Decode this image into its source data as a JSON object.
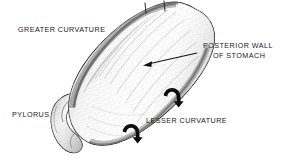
{
  "figure": {
    "kind": "anatomical-line-drawing",
    "subject": "stomach",
    "view": "posterior-oblique",
    "background_color": "#ffffff",
    "ink_color": "#1a1a1a",
    "width": 285,
    "height": 164
  },
  "labels": {
    "greater_curvature": "GREATER CURVATURE",
    "pylorus": "PYLORUS",
    "lesser_curvature": "LESSER CURVATURE",
    "posterior_wall_line1": "POSTERIOR WALL",
    "posterior_wall_line2": "OF STOMACH"
  },
  "annotations": {
    "leader_arrow": {
      "name": "posterior-wall-leader-arrow",
      "from_x": 197,
      "from_y": 53,
      "to_x": 144,
      "to_y": 65,
      "direction": "down-left"
    },
    "curved_arrows": [
      {
        "name": "rotation-arrow-upper",
        "x": 172,
        "y": 96,
        "rotation_deg": 0
      },
      {
        "name": "rotation-arrow-lower",
        "x": 131,
        "y": 132,
        "rotation_deg": 0
      }
    ],
    "fundus_ticks": [
      {
        "name": "fundus-tick-left",
        "x": 145,
        "y": 8
      },
      {
        "name": "fundus-tick-right",
        "x": 164,
        "y": 6
      }
    ]
  },
  "structures": {
    "body": "stomach-body",
    "fundus": "fundus",
    "pylorus": "pyloric-antrum-and-duodenal-bulb",
    "greater_curvature_edge": "greater-curvature-border",
    "lesser_curvature_edge": "lesser-curvature-border"
  }
}
